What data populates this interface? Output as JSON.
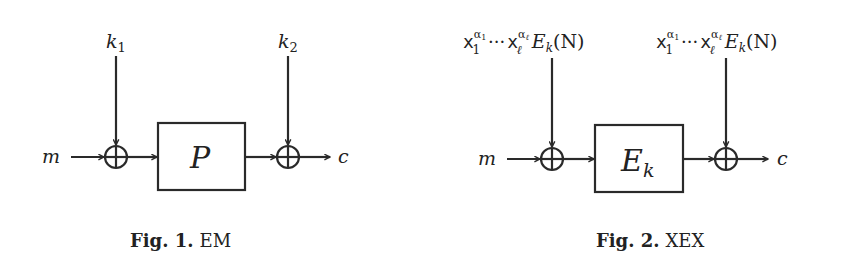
{
  "figures": [
    {
      "id": "fig1",
      "caption_label": "Fig. 1.",
      "caption_text": "EM",
      "input": "m",
      "output": "c",
      "box_label": "P",
      "box_sub": "",
      "left_key": "k",
      "left_key_sub": "1",
      "right_key": "k",
      "right_key_sub": "2"
    },
    {
      "id": "fig2",
      "caption_label": "Fig. 2.",
      "caption_text": "XEX",
      "input": "m",
      "output": "c",
      "box_label": "E",
      "box_sub": "k",
      "left_mask": {
        "x1": "x",
        "x1_sub": "1",
        "x1_sup": "α",
        "x1_sup_sub": "1",
        "dots": "···",
        "xl": "x",
        "xl_sub": "ℓ",
        "xl_sup": "α",
        "xl_sup_sub": "ℓ",
        "E": "E",
        "E_sub": "k",
        "arg": "(N)"
      },
      "right_mask": {
        "x1": "x",
        "x1_sub": "1",
        "x1_sup": "α",
        "x1_sup_sub": "1",
        "dots": "···",
        "xl": "x",
        "xl_sub": "ℓ",
        "xl_sup": "α",
        "xl_sup_sub": "ℓ",
        "E": "E",
        "E_sub": "k",
        "arg": "(N)"
      }
    }
  ]
}
